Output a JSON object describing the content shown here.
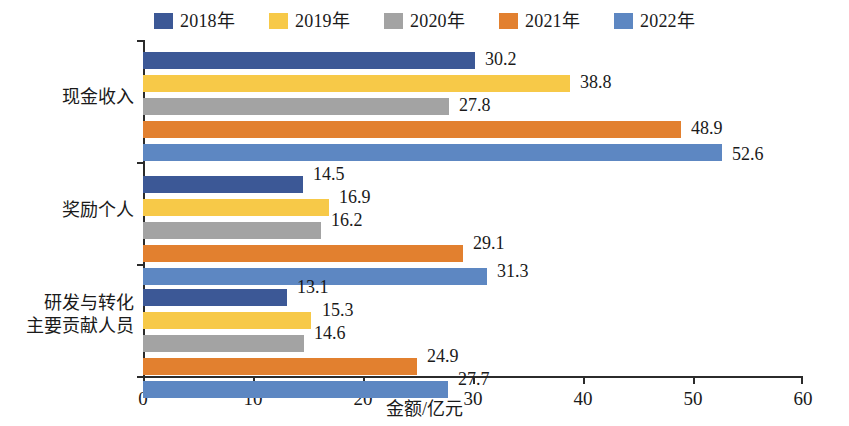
{
  "chart_data": {
    "type": "bar",
    "orientation": "horizontal",
    "title": "",
    "subtitle": "",
    "xlabel": "金额/亿元",
    "ylabel": "",
    "xlim": [
      0,
      60
    ],
    "xticks": [
      0,
      10,
      20,
      30,
      40,
      50,
      60
    ],
    "grid": false,
    "legend_position": "top-center",
    "categories": [
      "现金收入",
      "奖励个人",
      "研发与转化主要贡献人员"
    ],
    "category_lines": [
      [
        "现金收入"
      ],
      [
        "奖励个人"
      ],
      [
        "研发与转化",
        "主要贡献人员"
      ]
    ],
    "series": [
      {
        "name": "2018年",
        "color": "#3c5896",
        "values": [
          30.2,
          14.5,
          13.1
        ]
      },
      {
        "name": "2019年",
        "color": "#f7c948",
        "values": [
          38.8,
          16.9,
          15.3
        ]
      },
      {
        "name": "2020年",
        "color": "#a3a3a3",
        "values": [
          27.8,
          16.2,
          14.6
        ]
      },
      {
        "name": "2021年",
        "color": "#e2802f",
        "values": [
          48.9,
          29.1,
          24.9
        ]
      },
      {
        "name": "2022年",
        "color": "#5d87c2",
        "values": [
          52.6,
          31.3,
          27.7
        ]
      }
    ],
    "value_labels": [
      [
        "30.2",
        "38.8",
        "27.8",
        "48.9",
        "52.6"
      ],
      [
        "14.5",
        "16.9",
        "16.2",
        "29.1",
        "31.3"
      ],
      [
        "13.1",
        "15.3",
        "14.6",
        "24.9",
        "27.7"
      ]
    ],
    "xtick_labels": [
      "0",
      "10",
      "20",
      "30",
      "40",
      "50",
      "60"
    ],
    "legend_labels": [
      "2018年",
      "2019年",
      "2020年",
      "2021年",
      "2022年"
    ],
    "axis_color": "#2b2b2b",
    "background_color": "#ffffff"
  }
}
